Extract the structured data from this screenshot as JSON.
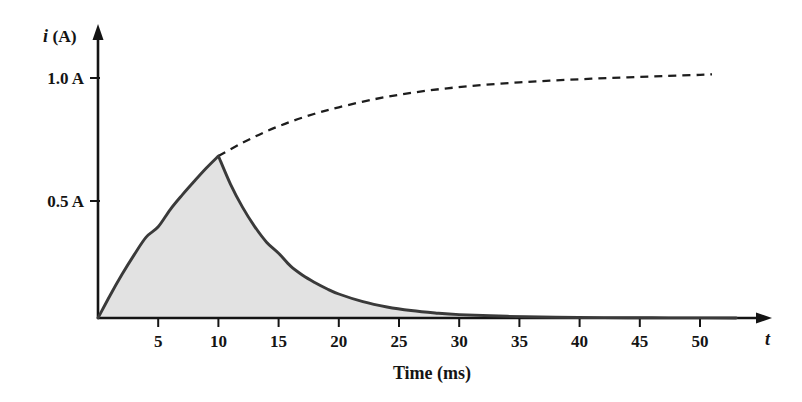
{
  "chart_data": {
    "type": "line",
    "title": "",
    "xlabel": "Time (ms)",
    "ylabel": "i (A)",
    "x_axis_symbol": "t",
    "y_axis_symbol": "i (A)",
    "xlim": [
      0,
      53
    ],
    "ylim": [
      0,
      1.12
    ],
    "grid": false,
    "legend": "none",
    "xticks": [
      5,
      10,
      15,
      20,
      25,
      30,
      35,
      40,
      45,
      50
    ],
    "xtick_labels": [
      "5",
      "10",
      "15",
      "20",
      "25",
      "30",
      "35",
      "40",
      "45",
      "50"
    ],
    "yticks": [
      0.5,
      1.0
    ],
    "ytick_labels": [
      "0.5 A",
      "1.0 A"
    ],
    "fill_color": "#e2e2e2",
    "solid_curve_color": "#3a3a3a",
    "dashed_curve_color": "#1d1d1d",
    "annotations": [],
    "series": [
      {
        "name": "charging-then-decay",
        "style": "solid",
        "filled": true,
        "description": "Current rises exponentially to 0.675 A at t = 10 ms, then decays exponentially toward zero",
        "x": [
          0,
          1,
          2,
          3,
          4,
          5,
          6,
          7,
          8,
          9,
          10,
          10,
          11,
          12,
          13,
          14,
          15,
          16,
          17,
          18,
          19,
          20,
          22,
          24,
          26,
          28,
          30,
          34,
          38,
          42,
          46,
          50,
          53
        ],
        "y": [
          0,
          0.094,
          0.182,
          0.263,
          0.337,
          0.38,
          0.452,
          0.513,
          0.57,
          0.625,
          0.675,
          0.675,
          0.558,
          0.462,
          0.382,
          0.316,
          0.27,
          0.216,
          0.178,
          0.148,
          0.122,
          0.1,
          0.068,
          0.046,
          0.031,
          0.021,
          0.014,
          0.007,
          0.003,
          0.0015,
          0.0008,
          0.0004,
          0.0002
        ]
      },
      {
        "name": "continued-charging",
        "style": "dashed",
        "filled": false,
        "description": "Dashed extension showing current continuing to rise asymptotically toward about 1.02 A",
        "x": [
          10,
          12,
          14,
          16,
          18,
          20,
          23,
          26,
          29,
          32,
          35,
          38,
          41,
          44,
          47,
          50,
          51
        ],
        "y": [
          0.675,
          0.73,
          0.778,
          0.818,
          0.851,
          0.878,
          0.912,
          0.938,
          0.957,
          0.971,
          0.982,
          0.99,
          0.997,
          1.003,
          1.008,
          1.013,
          1.015
        ]
      }
    ]
  },
  "labels": {
    "y_axis_caption": "i (A)",
    "y_axis_caption_italic": "i",
    "y_axis_caption_rest": " (A)",
    "x_axis_caption": "t",
    "x_axis_title": "Time (ms)",
    "ytick_0": "0.5 A",
    "ytick_1": "1.0 A",
    "xtick_0": "5",
    "xtick_1": "10",
    "xtick_2": "15",
    "xtick_3": "20",
    "xtick_4": "25",
    "xtick_5": "30",
    "xtick_6": "35",
    "xtick_7": "40",
    "xtick_8": "45",
    "xtick_9": "50"
  }
}
